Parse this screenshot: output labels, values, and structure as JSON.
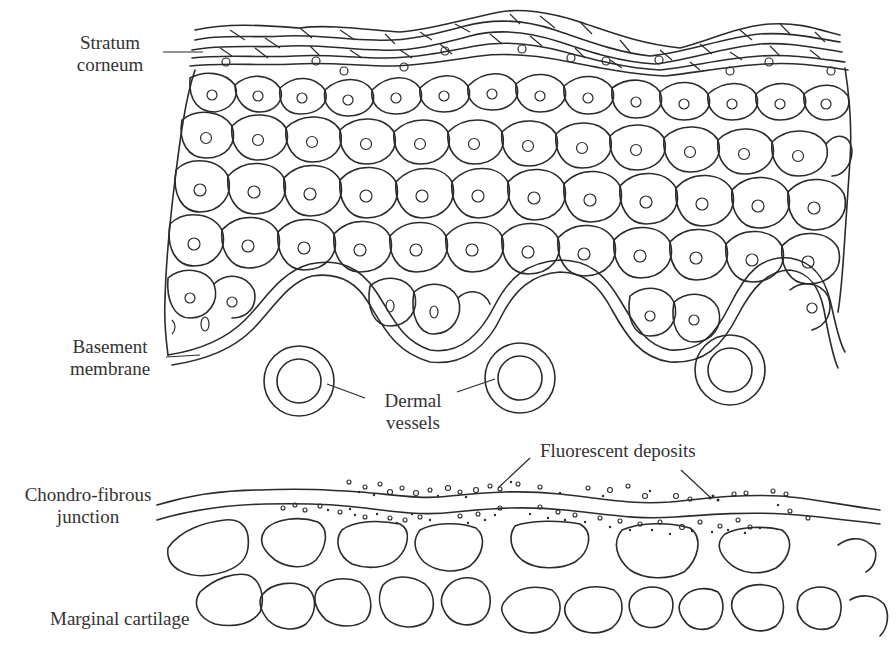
{
  "figure": {
    "colors": {
      "ink": "#2b2b2b",
      "text": "#333333",
      "background": "#ffffff"
    }
  },
  "top_panel": {
    "title": "Epidermis and dermis",
    "labels": {
      "stratum_corneum_line1": "Stratum",
      "stratum_corneum_line2": "corneum",
      "basement_membrane_line1": "Basement",
      "basement_membrane_line2": "membrane",
      "dermal_vessels_line1": "Dermal",
      "dermal_vessels_line2": "vessels"
    },
    "structures": [
      "stratum-corneum",
      "keratinocyte-layers",
      "basement-membrane",
      "dermal-papillae",
      "dermal-vessels"
    ],
    "dermal_vessel_count": 3,
    "rete_ridge_count": 3
  },
  "bottom_panel": {
    "title": "Chondro-fibrous junction",
    "labels": {
      "fluorescent_deposits": "Fluorescent deposits",
      "chondro_fibrous_line1": "Chondro-fibrous",
      "chondro_fibrous_line2": "junction",
      "marginal_cartilage": "Marginal cartilage"
    },
    "structures": [
      "fibrous-band",
      "fluorescent-deposits",
      "cartilage-lacunae-row-1",
      "cartilage-lacunae-row-2"
    ],
    "lacunae_row1_count": 8,
    "lacunae_row2_count": 8
  }
}
